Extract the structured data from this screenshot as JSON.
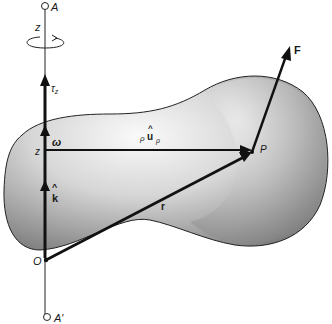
{
  "figure": {
    "colors": {
      "ink": "#111111",
      "body_light": "#f2f2f2",
      "body_mid": "#c8c8c8",
      "body_dark": "#8a8a8a",
      "background": "#ffffff"
    }
  },
  "labels": {
    "point_A": "A",
    "point_A_prime": "A′",
    "axis_z_top": "z",
    "torque": "τ",
    "torque_sub": "z",
    "omega": "ω",
    "center_z": "z",
    "unit_k": "k",
    "origin": "O",
    "rho": "ρ",
    "unit_u": "u",
    "u_sub": "ρ",
    "point_P": "P",
    "position_r": "r",
    "force_F": "F",
    "hat": "^"
  },
  "icons": {
    "rotation": "rotation-ellipse-arrow-icon",
    "endpoint": "open-circle-icon"
  }
}
